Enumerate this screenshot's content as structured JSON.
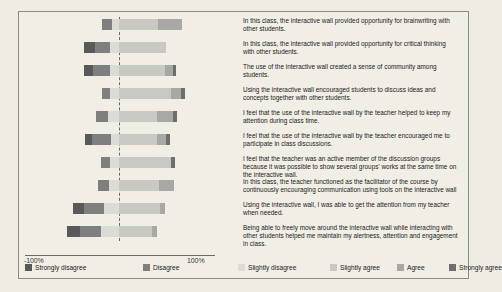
{
  "chart": {
    "type": "bar",
    "title": "",
    "xlabel": "",
    "ylabel": "",
    "axis": {
      "left_tick": "-100%",
      "right_tick": "100%",
      "xlim": [
        -100,
        100
      ],
      "zero_line": "dashed",
      "grid": false
    },
    "legend": {
      "position": "bottom",
      "entries": [
        {
          "label": "Strongly disagree",
          "color": "#595959"
        },
        {
          "label": "Disagree",
          "color": "#7f7f7f"
        },
        {
          "label": "Slightly disagree",
          "color": "#dcdcd6"
        },
        {
          "label": "Slightly agree",
          "color": "#c9c9c4"
        },
        {
          "label": "Agree",
          "color": "#a8a8a4"
        },
        {
          "label": "Strongly agree",
          "color": "#6e6e6e"
        }
      ]
    }
  },
  "chart_data": {
    "type": "bar",
    "title": "",
    "xlabel": "",
    "ylabel": "",
    "xlim": [
      -100,
      100
    ],
    "grid": false,
    "legend_position": "bottom",
    "stacked": "diverging",
    "categories": [
      "Strongly disagree",
      "Disagree",
      "Slightly disagree",
      "Slightly agree",
      "Agree",
      "Strongly agree"
    ],
    "colors": [
      "#595959",
      "#7f7f7f",
      "#dcdcd6",
      "#c9c9c4",
      "#a8a8a4",
      "#6e6e6e"
    ],
    "items": [
      {
        "statement": "In this class, the interactive wall provided opportunity for brainwriting with other students.",
        "values": [
          0,
          10,
          8,
          42,
          26,
          0
        ]
      },
      {
        "statement": "In this class, the interactive wall provided opportunity for critical thinking with other students.",
        "values": [
          12,
          16,
          10,
          51,
          0,
          0
        ]
      },
      {
        "statement": "The use of the interactive wall created a sense of community among students.",
        "values": [
          10,
          18,
          10,
          50,
          9,
          3
        ]
      },
      {
        "statement": "Using the interactive wall encouraged students to discuss ideas and concepts together with other students.",
        "values": [
          0,
          8,
          10,
          56,
          11,
          5
        ]
      },
      {
        "statement": "I feel that the use of the interactive wall by the teacher helped to keep my attention during class time.",
        "values": [
          0,
          13,
          12,
          41,
          18,
          4
        ]
      },
      {
        "statement": "I feel that the use of the interactive wall by the teacher encouraged me to participate in class discussions.",
        "values": [
          8,
          20,
          9,
          41,
          10,
          4
        ]
      },
      {
        "statement": "I feel that the teacher was an active member of the discussion groups because it was possible to show several groups' works at the same time on the interactive wall.",
        "values": [
          0,
          10,
          10,
          57,
          0,
          4
        ]
      },
      {
        "statement": "In this class, the teacher functioned as the facilitator of the course by continuously encouraging communication using tools on the interactive wall",
        "values": [
          0,
          12,
          11,
          43,
          17,
          0
        ]
      },
      {
        "statement": "Using the interactive wall, I was able to get the attention from my teacher when needed.",
        "values": [
          12,
          22,
          16,
          45,
          5,
          0
        ]
      },
      {
        "statement": "Being able to freely move around the interactive wall while interacting with other students helped me maintain my alertness, attention and engagement in class.",
        "values": [
          14,
          22,
          20,
          36,
          5,
          0
        ]
      }
    ]
  }
}
